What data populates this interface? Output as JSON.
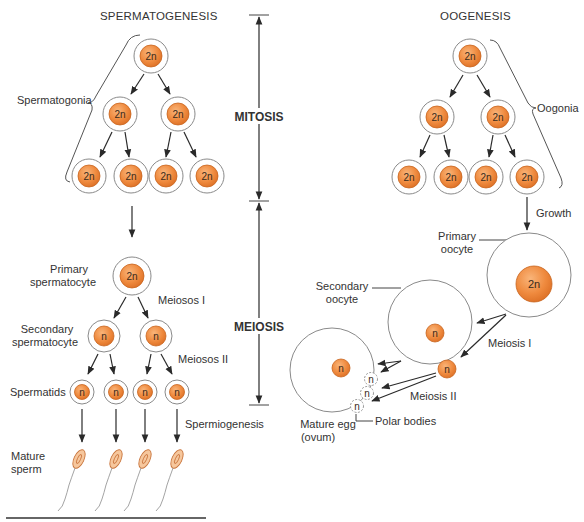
{
  "titles": {
    "left": "SPERMATOGENESIS",
    "right": "OOGENESIS"
  },
  "phases": {
    "mitosis": "MITOSIS",
    "meiosis": "MEIOSIS"
  },
  "spermatogenesis": {
    "labels": {
      "spermatogonia": "Spermatogonia",
      "primary_line1": "Primary",
      "primary_line2": "spermatocyte",
      "meiosis1": "Meiosos I",
      "secondary_line1": "Secondary",
      "secondary_line2": "spermatocyte",
      "meiosis2": "Meiosos II",
      "spermatids": "Spermatids",
      "spermiogenesis": "Spermiogenesis",
      "mature_line1": "Mature",
      "mature_line2": "sperm"
    },
    "ploidy": {
      "gonia_top": "2n",
      "gonia_mid": [
        "2n",
        "2n"
      ],
      "gonia_bottom": [
        "2n",
        "2n",
        "2n",
        "2n"
      ],
      "primary": "2n",
      "secondary": [
        "n",
        "n"
      ],
      "spermatids": [
        "n",
        "n",
        "n",
        "n"
      ]
    }
  },
  "oogenesis": {
    "labels": {
      "oogonia": "Oogonia",
      "growth": "Growth",
      "primary_line1": "Primary",
      "primary_line2": "oocyte",
      "secondary_line1": "Secondary",
      "secondary_line2": "oocyte",
      "meiosis1": "Meiosis I",
      "meiosis2": "Meiosis II",
      "mature_line1": "Mature egg",
      "mature_line2": "(ovum)",
      "polar_bodies": "Polar bodies"
    },
    "ploidy": {
      "gonia_top": "2n",
      "gonia_mid": [
        "2n",
        "2n"
      ],
      "gonia_bottom": [
        "2n",
        "2n",
        "2n",
        "2n"
      ],
      "primary": "2n",
      "secondary": "n",
      "first_polar": "n",
      "ovum": "n",
      "polar_bodies": [
        "n",
        "n",
        "n"
      ]
    }
  },
  "colors": {
    "nucleus": "#ee8a3c",
    "nucleus_highlight": "#f8b77a",
    "membrane": "#8a8a8a",
    "sperm_head": "#f6c79d"
  }
}
